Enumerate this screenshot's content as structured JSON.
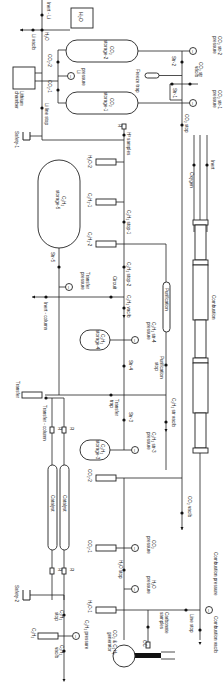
{
  "diagram": {
    "orientation": "rotated-90-clockwise"
  },
  "labels": {
    "inert_li": "Inert - Li",
    "h2o_box": "H₂O",
    "li_vac": "Li vac/b",
    "h2o": "H₂O",
    "co2_2": "CO₂-2",
    "co2_1": "CO₂-1",
    "li_pressure": "Li pressure",
    "lithium_chamber": "Lithium chamber",
    "li_line_stop": "Li line stop",
    "co2_storage_2": "CO₂ storage-2",
    "co2_storage_1": "CO₂ storage-1",
    "freeze_trap": "Freeze trap",
    "str_2": "Str-2",
    "str_1": "Str-1",
    "co2_str_vac": "CO₂ str vac/b",
    "co2_str_2_pressure": "CO₂ str-2 pressure",
    "co2_str_1_pressure": "CO₂ str-1 pressure",
    "co2_stop": "CO₂ stop",
    "safety_1": "Safety-1",
    "h2_samples": "H³ samples",
    "h2o_2": "H₂O-2",
    "c2h2_1": "C₂H₂-1",
    "c2h2_2": "C₂H₂-2",
    "c2h2_storage_5": "C₂H₂ storage-5",
    "c2h2_stop_1": "C₂H₂ stop-1",
    "c2h2_stop_2": "C₂H₂ stop-2",
    "c2h2_vac": "C₂H₂ vac/b",
    "circuit": "Circuit",
    "str_5": "Str-5",
    "transfer_pressure": "Transfer pressure",
    "inert_column": "Inert - column",
    "purification": "Purification",
    "purification_stop": "Purification stop",
    "c2h2_storage_4": "C₂H₂ storage-4",
    "c2h2_str_4_pressure": "C₂H₂ str-4 pressure",
    "str_4": "Str-4",
    "transfer": "Transfer",
    "transfer_trap": "Transfer trap",
    "transfer_column": "Transfer - column",
    "str_3": "Str-3",
    "c2h2_storage_3": "C₂H₂ storage-3",
    "c2h2_str_3_pressure": "C₂H₂ str-3 pressure",
    "c2h2_str_vac": "C₂H₂ str vac/b",
    "catalyst_a": "Catalyst",
    "catalyst_b": "Catalyst",
    "co2_2b": "CO₂-2",
    "co2_1b": "CO₂-1",
    "co2_vac": "CO₂ vac/b",
    "co2_pressure": "CO₂ pressure",
    "h2o_stop": "H₂O stop",
    "h2o_pressure": "H₂O pressure",
    "h2o_1": "H₂O-1",
    "safety_2": "Safety-2",
    "c2h2_stop": "C₂H₂ stop",
    "c2h2_pressure": "C₂H₂ pressure",
    "c2h2": "C₂H₂",
    "c2h2_vacb": "C₂H₂ vac/b",
    "carbonate_samples": "Carbonate samples",
    "co2_c2h2_generator": "CO₂ & C₂H₂ generator",
    "line_stop": "Line stop",
    "combustion_pressure": "Combustion pressure",
    "combustion_vac": "Combustion vac/b",
    "combustion": "Combustion",
    "inert": "Inert",
    "oxygen": "Oxygen",
    "oc": "OC",
    "r": "R"
  },
  "gauge_symbol": "I"
}
